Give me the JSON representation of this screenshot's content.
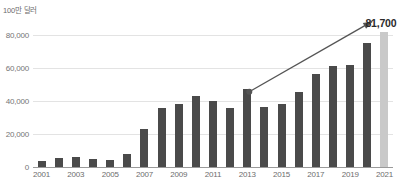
{
  "chart_data": {
    "type": "bar",
    "title": "",
    "subtitle": "",
    "xlabel": "",
    "ylabel": "100만 달러",
    "ylim": [
      0,
      88000
    ],
    "grid": true,
    "legend": false,
    "categories": [
      "2001",
      "2002",
      "2003",
      "2004",
      "2005",
      "2006",
      "2007",
      "2008",
      "2009",
      "2010",
      "2011",
      "2012",
      "2013",
      "2014",
      "2015",
      "2016",
      "2017",
      "2018",
      "2019",
      "2020",
      "2021"
    ],
    "values": [
      3500,
      5500,
      6000,
      5000,
      4500,
      8000,
      23000,
      36000,
      38000,
      43000,
      40000,
      36000,
      47500,
      36500,
      38500,
      45500,
      56500,
      61500,
      62000,
      75000,
      81700
    ],
    "x_tick_labels": [
      "2001",
      "2003",
      "2005",
      "2007",
      "2009",
      "2011",
      "2013",
      "2015",
      "2017",
      "2019",
      "2021"
    ],
    "y_tick_labels": [
      "0",
      "20,000",
      "40,000",
      "60,000",
      "80,000"
    ],
    "y_tick_values": [
      0,
      20000,
      40000,
      60000,
      80000
    ],
    "highlight_category": "2021",
    "highlight_color": "#c9c9c9",
    "bar_color": "#4a4a4a",
    "gridline_color": "#e3e3e3",
    "annotations": [
      {
        "name": "value-callout",
        "text": "81,700",
        "category": "2021",
        "value": 81700
      },
      {
        "name": "trend-arrow",
        "text": "",
        "from_category": "2013",
        "to_category": "2020",
        "direction": "up-right"
      }
    ]
  },
  "footnote": {
    "text": ""
  }
}
